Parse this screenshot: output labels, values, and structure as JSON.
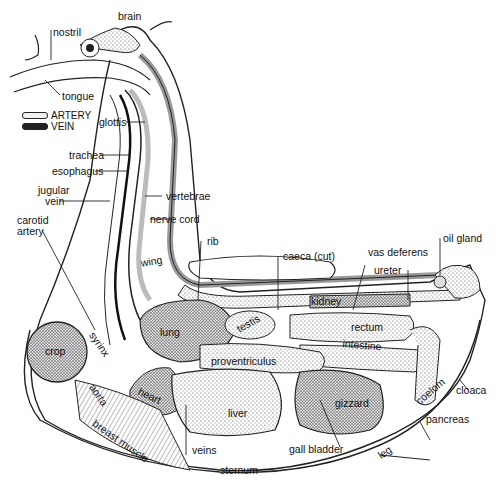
{
  "diagram": {
    "legend": [
      {
        "label": "ARTERY",
        "swatch": "light"
      },
      {
        "label": "VEIN",
        "swatch": "dark"
      }
    ],
    "labels": {
      "brain": "brain",
      "nostril": "nostril",
      "tongue": "tongue",
      "glottis": "glottis",
      "trachea": "trachea",
      "esophagus": "esophagus",
      "jugular_vein": "jugular\nvein",
      "jugular": "jugular",
      "vein": "vein",
      "vertebrae": "vertebrae",
      "carotid": "carotid",
      "artery": "artery",
      "nerve_cord": "nerve cord",
      "rib": "rib",
      "wing": "wing",
      "caeca": "caeca (cut)",
      "vas_deferens": "vas deferens",
      "oil_gland": "oil gland",
      "ureter": "ureter",
      "kidney": "kidney",
      "syrinx": "syrinx",
      "lung": "lung",
      "testis": "testis",
      "rectum": "rectum",
      "intestine": "intestine",
      "crop": "crop",
      "proventriculus": "proventriculus",
      "cloaca": "cloaca",
      "coelom": "coelom",
      "aorta": "aorta",
      "heart": "heart",
      "liver": "liver",
      "gizzard": "gizzard",
      "pancreas": "pancreas",
      "breast_muscle": "breast muscle",
      "veins": "veins",
      "gall_bladder": "gall bladder",
      "leg": "leg",
      "sternum": "sternum"
    }
  }
}
